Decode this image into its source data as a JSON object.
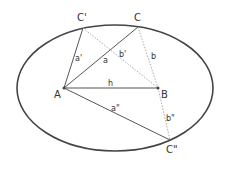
{
  "diagram": {
    "ellipse": {
      "cx": 115,
      "cy": 88,
      "rx": 98,
      "ry": 63,
      "stroke": "#444444"
    },
    "points": {
      "A": {
        "label": "A",
        "x": 64,
        "y": 88
      },
      "B": {
        "label": "B",
        "x": 158,
        "y": 88
      },
      "C": {
        "label": "C",
        "x": 138,
        "y": 27
      },
      "C1": {
        "label": "C'",
        "x": 83,
        "y": 28
      },
      "C2": {
        "label": "C\"",
        "x": 170,
        "y": 140
      }
    },
    "segments": {
      "h": "h",
      "a": "a",
      "a1": "a'",
      "a2": "a\"",
      "b": "b",
      "b1": "b'",
      "b2": "b\""
    },
    "colors": {
      "solid": "#555555",
      "dotted": "#aaaaaa"
    }
  }
}
